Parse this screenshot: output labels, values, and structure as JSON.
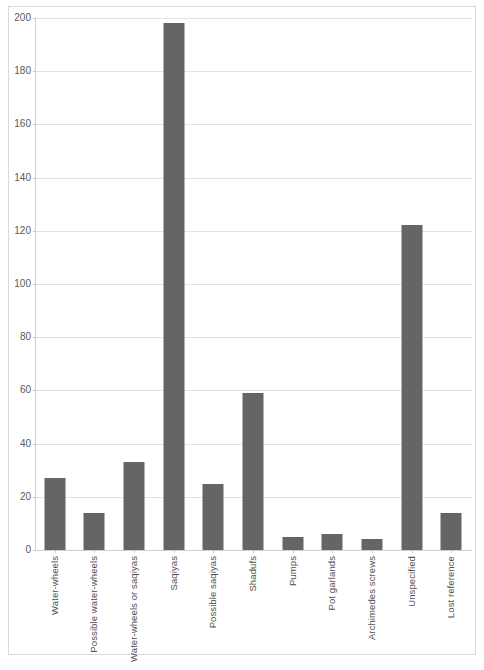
{
  "chart_data": {
    "type": "bar",
    "title": "",
    "subtitle": "",
    "xlabel": "",
    "ylabel": "",
    "ylim": [
      0,
      200
    ],
    "ytick_step": 20,
    "grid": "horizontal",
    "legend": "none",
    "bar_color": "#656565",
    "gridline_color": "#e2e2e2",
    "axis_color": "#d0d0d0",
    "label_color": "#4f4f4f",
    "orientation": "vertical",
    "xtick_rotation": 90,
    "categories": [
      "Water-wheels",
      "Possible water-wheels",
      "Water-wheels or saqiyas",
      "Saqiyas",
      "Possible saqiyas",
      "Shadufs",
      "Pumps",
      "Pot garlands",
      "Archimedes screws",
      "Unspecified",
      "Lost reference"
    ],
    "values": [
      27,
      14,
      33,
      198,
      25,
      59,
      5,
      6,
      4,
      122,
      14
    ],
    "ytick_labels": [
      "0",
      "20",
      "40",
      "60",
      "80",
      "100",
      "120",
      "140",
      "160",
      "180",
      "200"
    ],
    "ytick_values": [
      0,
      20,
      40,
      60,
      80,
      100,
      120,
      140,
      160,
      180,
      200
    ]
  }
}
